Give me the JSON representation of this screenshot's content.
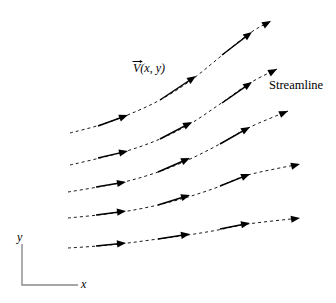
{
  "figure": {
    "width": 336,
    "height": 303,
    "background": "#ffffff",
    "line_color": "#000000",
    "axis_color": "#8a8a8a"
  },
  "labels": {
    "velocity_symbol": "V",
    "velocity_args": "(x, y)",
    "streamline": "Streamline",
    "axis_y": "y",
    "axis_x": "x"
  },
  "axes": {
    "origin": [
      22,
      285
    ],
    "y_axis_top": [
      22,
      244
    ],
    "x_axis_right": [
      78,
      285
    ],
    "color": "#8a8a8a",
    "stroke_width": 1.4
  },
  "chart_data": {
    "type": "line",
    "xlabel": "x",
    "ylabel": "y",
    "grid": false,
    "legend": null,
    "style": {
      "streamline_dash": "3,3",
      "streamline_width": 0.9,
      "vector_width": 1.5,
      "arrow_length": 9,
      "arrow_half_width": 3.6
    },
    "annotations": [
      {
        "text": "V(x, y)",
        "x": 133,
        "y": 72,
        "italic": true,
        "vector_accent": true
      },
      {
        "text": "Streamline",
        "x": 269,
        "y": 86,
        "italic": false
      }
    ],
    "series": [
      {
        "name": "streamline-1",
        "path": [
          [
            70,
            133
          ],
          [
            100,
            125
          ],
          [
            130,
            114
          ],
          [
            160,
            100
          ],
          [
            190,
            81
          ],
          [
            220,
            57
          ],
          [
            250,
            33
          ],
          [
            271,
            21
          ]
        ],
        "vectors": [
          {
            "from": [
              98,
              126
            ],
            "to": [
              128,
              115
            ]
          },
          {
            "from": [
              160,
              100
            ],
            "to": [
              196,
              76
            ]
          },
          {
            "from": [
              222,
              55
            ],
            "to": [
              252,
              32
            ]
          }
        ],
        "terminal_arrow": {
          "at": [
            271,
            21
          ],
          "angle_deg": -29
        }
      },
      {
        "name": "streamline-2",
        "path": [
          [
            70,
            165
          ],
          [
            100,
            158
          ],
          [
            130,
            150
          ],
          [
            160,
            139
          ],
          [
            190,
            124
          ],
          [
            220,
            104
          ],
          [
            250,
            83
          ],
          [
            277,
            69
          ]
        ],
        "vectors": [
          {
            "from": [
              98,
              158
            ],
            "to": [
              128,
              151
            ]
          },
          {
            "from": [
              160,
              139
            ],
            "to": [
              192,
              122
            ]
          },
          {
            "from": [
              222,
              103
            ],
            "to": [
              252,
              82
            ]
          }
        ],
        "terminal_arrow": {
          "at": [
            277,
            69
          ],
          "angle_deg": -28
        }
      },
      {
        "name": "streamline-3",
        "path": [
          [
            68,
            192
          ],
          [
            98,
            187
          ],
          [
            128,
            181
          ],
          [
            158,
            172
          ],
          [
            188,
            160
          ],
          [
            218,
            145
          ],
          [
            248,
            128
          ],
          [
            288,
            111
          ]
        ],
        "vectors": [
          {
            "from": [
              96,
              187
            ],
            "to": [
              126,
              182
            ]
          },
          {
            "from": [
              158,
              172
            ],
            "to": [
              190,
              158
            ]
          },
          {
            "from": [
              220,
              144
            ],
            "to": [
              250,
              127
            ]
          }
        ],
        "terminal_arrow": {
          "at": [
            288,
            111
          ],
          "angle_deg": -23
        }
      },
      {
        "name": "streamline-4",
        "path": [
          [
            68,
            218
          ],
          [
            98,
            215
          ],
          [
            128,
            211
          ],
          [
            158,
            205
          ],
          [
            188,
            197
          ],
          [
            218,
            187
          ],
          [
            248,
            175
          ],
          [
            300,
            164
          ]
        ],
        "vectors": [
          {
            "from": [
              96,
              215
            ],
            "to": [
              126,
              211
            ]
          },
          {
            "from": [
              158,
              205
            ],
            "to": [
              190,
              195
            ]
          },
          {
            "from": [
              220,
              186
            ],
            "to": [
              250,
              174
            ]
          }
        ],
        "terminal_arrow": {
          "at": [
            300,
            164
          ],
          "angle_deg": -14
        }
      },
      {
        "name": "streamline-5",
        "path": [
          [
            68,
            248
          ],
          [
            98,
            246
          ],
          [
            128,
            243
          ],
          [
            158,
            239
          ],
          [
            188,
            235
          ],
          [
            218,
            230
          ],
          [
            248,
            224
          ],
          [
            300,
            218
          ]
        ],
        "vectors": [
          {
            "from": [
              96,
              246
            ],
            "to": [
              126,
              243
            ]
          },
          {
            "from": [
              158,
              239
            ],
            "to": [
              190,
              234
            ]
          },
          {
            "from": [
              220,
              229
            ],
            "to": [
              250,
              223
            ]
          }
        ],
        "terminal_arrow": {
          "at": [
            300,
            218
          ],
          "angle_deg": -8
        }
      }
    ]
  }
}
